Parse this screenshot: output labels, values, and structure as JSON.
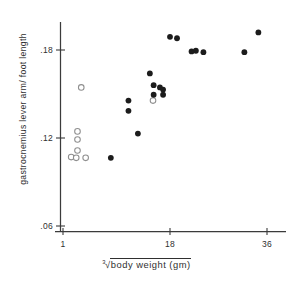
{
  "chart_data": {
    "type": "scatter",
    "title": "",
    "xlabel": "³√body weight (gm)",
    "xlabel_parts": {
      "index": "3",
      "radicand": "body weight (gm)"
    },
    "ylabel": "gastrocnemius lever arm/ foot length",
    "xlim": [
      1,
      38
    ],
    "ylim": [
      0.055,
      0.205
    ],
    "xticks": [
      1,
      18,
      36
    ],
    "xtick_labels": [
      "1",
      "18",
      "36"
    ],
    "yticks": [
      0.06,
      0.12,
      0.18
    ],
    "ytick_labels": [
      ".06",
      ".12",
      ".18"
    ],
    "grid": false,
    "legend": "none",
    "series": [
      {
        "name": "open-circles",
        "marker": "open-circle",
        "color": "#8e8e8e",
        "points": [
          {
            "x": 3.9,
            "y": 0.1545
          },
          {
            "x": 3.3,
            "y": 0.1245
          },
          {
            "x": 3.3,
            "y": 0.119
          },
          {
            "x": 3.3,
            "y": 0.1115
          },
          {
            "x": 2.3,
            "y": 0.107
          },
          {
            "x": 3.1,
            "y": 0.1065
          },
          {
            "x": 4.6,
            "y": 0.1065
          },
          {
            "x": 15.3,
            "y": 0.1455
          }
        ]
      },
      {
        "name": "filled-circles",
        "marker": "filled-circle",
        "color": "#1c1c1c",
        "points": [
          {
            "x": 8.6,
            "y": 0.1065
          },
          {
            "x": 11.4,
            "y": 0.1455
          },
          {
            "x": 11.4,
            "y": 0.1385
          },
          {
            "x": 12.9,
            "y": 0.123
          },
          {
            "x": 14.8,
            "y": 0.164
          },
          {
            "x": 15.4,
            "y": 0.156
          },
          {
            "x": 15.4,
            "y": 0.1495
          },
          {
            "x": 16.4,
            "y": 0.1545
          },
          {
            "x": 16.9,
            "y": 0.153
          },
          {
            "x": 16.9,
            "y": 0.1495
          },
          {
            "x": 18.0,
            "y": 0.189
          },
          {
            "x": 19.3,
            "y": 0.188
          },
          {
            "x": 22.0,
            "y": 0.179
          },
          {
            "x": 22.8,
            "y": 0.1795
          },
          {
            "x": 24.2,
            "y": 0.1785
          },
          {
            "x": 31.8,
            "y": 0.1785
          },
          {
            "x": 34.4,
            "y": 0.192
          }
        ]
      }
    ]
  },
  "axes": {
    "x_axis_name": "x-axis",
    "y_axis_name": "y-axis"
  }
}
